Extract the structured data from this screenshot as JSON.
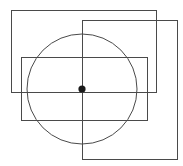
{
  "figure": {
    "width": 183,
    "height": 166,
    "background_color": "#ffffff",
    "stroke_color": "#4a4a4a",
    "stroke_width": 1,
    "dot_color": "#1a1a1a",
    "shapes": [
      {
        "name": "rectangle-1",
        "type": "rect",
        "x": 11,
        "y": 10,
        "width": 145,
        "height": 82,
        "label": "Rectangle 1"
      },
      {
        "name": "rectangle-2",
        "type": "rect",
        "x": 82,
        "y": 20,
        "width": 95,
        "height": 139,
        "label": "Rectangle 2"
      },
      {
        "name": "rectangle-3",
        "type": "rect",
        "x": 21,
        "y": 57,
        "width": 126,
        "height": 63,
        "label": "Rectangle 3"
      },
      {
        "name": "circle",
        "type": "circle",
        "cx": 82,
        "cy": 89,
        "r": 55,
        "label": "Circle"
      },
      {
        "name": "center-point",
        "type": "dot",
        "cx": 82,
        "cy": 89,
        "r": 3.6,
        "label": "Center point"
      }
    ]
  }
}
